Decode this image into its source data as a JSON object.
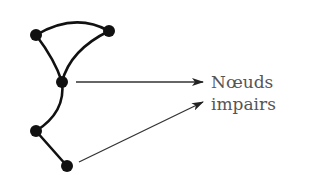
{
  "diagram": {
    "type": "graph",
    "label_lines": [
      "Nœuds",
      "impairs"
    ],
    "colors": {
      "node": "#111111",
      "edge": "#111111",
      "arrow": "#333333",
      "label": "#555555"
    },
    "nodes": [
      {
        "id": "A",
        "x": 36,
        "y": 35,
        "odd": false
      },
      {
        "id": "B",
        "x": 109,
        "y": 31,
        "odd": false
      },
      {
        "id": "C",
        "x": 62,
        "y": 82,
        "odd": true
      },
      {
        "id": "D",
        "x": 36,
        "y": 131,
        "odd": false
      },
      {
        "id": "E",
        "x": 67,
        "y": 166,
        "odd": true
      }
    ],
    "edges": [
      [
        "A",
        "B"
      ],
      [
        "A",
        "C"
      ],
      [
        "B",
        "C"
      ],
      [
        "C",
        "D"
      ],
      [
        "D",
        "E"
      ]
    ],
    "arrows": [
      {
        "from": "C",
        "to_label": "Nœuds impairs"
      },
      {
        "from": "E",
        "to_label": "Nœuds impairs"
      }
    ]
  }
}
